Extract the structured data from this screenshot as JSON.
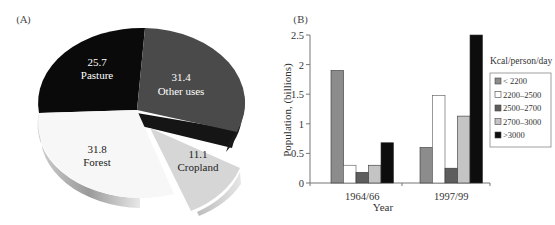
{
  "panels": {
    "a_label": "(A)",
    "b_label": "(B)"
  },
  "chart_data": [
    {
      "type": "pie",
      "panel": "(A)",
      "title": "",
      "slices": [
        {
          "label": "Pasture",
          "value": 25.7,
          "value_text": "25.7",
          "color": "#0a0a0a",
          "text_color": "#ffffff"
        },
        {
          "label": "Other uses",
          "value": 31.4,
          "value_text": "31.4",
          "color": "#4a4a4a",
          "text_color": "#ffffff"
        },
        {
          "label": "Cropland",
          "value": 11.1,
          "value_text": "11.1",
          "color": "#d4d4d4",
          "text_color": "#222222",
          "exploded": true
        },
        {
          "label": "Forest",
          "value": 31.8,
          "value_text": "31.8",
          "color": "#f7f7f7",
          "text_color": "#222222"
        }
      ]
    },
    {
      "type": "bar",
      "panel": "(B)",
      "title": "",
      "xlabel": "Year",
      "ylabel": "Population, (billions)",
      "ylim": [
        0,
        2.5
      ],
      "yticks": [
        "0",
        "0.5",
        "1",
        "1.5",
        "2",
        "2.5"
      ],
      "categories": [
        "1964/66",
        "1997/99"
      ],
      "legend_title": "Kcal/person/day",
      "legend_position": "right",
      "grid": false,
      "series": [
        {
          "name": "< 2200",
          "color": "#8c8c8c",
          "values": [
            1.9,
            0.6
          ]
        },
        {
          "name": "2200–2500",
          "color": "#ffffff",
          "values": [
            0.3,
            1.48
          ]
        },
        {
          "name": "2500–2700",
          "color": "#5e5e5e",
          "values": [
            0.18,
            0.25
          ]
        },
        {
          "name": "2700–3000",
          "color": "#c4c4c4",
          "values": [
            0.3,
            1.13
          ]
        },
        {
          "name": ">3000",
          "color": "#0d0d0d",
          "values": [
            0.68,
            2.5
          ]
        }
      ]
    }
  ]
}
